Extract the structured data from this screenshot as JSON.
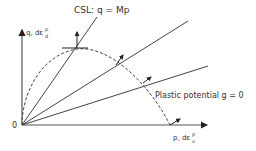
{
  "diagram": {
    "y_axis_label": "q, dε",
    "y_axis_sup": "p",
    "y_axis_sub": "d",
    "x_axis_label": "p, dε",
    "x_axis_sup": "p",
    "x_axis_sub": "v",
    "origin_label": "0",
    "csl_label": "CSL: q = Mp",
    "plastic_potential_label": "Plastic potential g = 0",
    "colors": {
      "line": "#333333",
      "background": "#ffffff"
    }
  }
}
